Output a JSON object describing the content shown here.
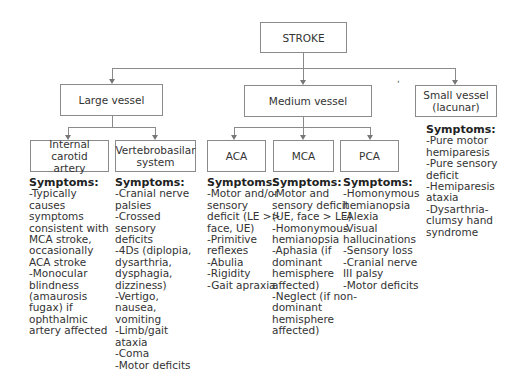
{
  "root": {
    "label": "STROKE"
  },
  "level1": [
    {
      "label": "Large vessel"
    },
    {
      "label": "Medium vessel"
    },
    {
      "label": "Small vessel\n(lacunar)"
    }
  ],
  "large": [
    {
      "label": "Internal carotid\nartery",
      "symptoms_title": "Symptoms:",
      "symptoms": "-Typically\ncauses\nsymptoms\nconsistent with\nMCA stroke,\noccasionally\nACA stroke\n-Monocular\nblindness\n(amaurosis\nfugax) if\nophthalmic\nartery affected"
    },
    {
      "label": "Vertebrobasilar\nsystem",
      "symptoms_title": "Symptoms:",
      "symptoms": "-Cranial nerve\npalsies\n-Crossed\nsensory\ndeficits\n-4Ds (diplopia,\ndysarthria,\ndysphagia,\ndizziness)\n-Vertigo,\nnausea,\nvomiting\n-Limb/gait\nataxia\n-Coma\n-Motor deficits"
    }
  ],
  "medium": [
    {
      "label": "ACA",
      "symptoms_title": "Symptoms:",
      "symptoms": "-Motor and/or\nsensory\ndeficit (LE >>\nface, UE)\n-Primitive\nreflexes\n-Abulia\n-Rigidity\n-Gait apraxia"
    },
    {
      "label": "MCA",
      "symptoms_title": "Symptoms:",
      "symptoms": "-Motor and\nsensory deficit\n(UE, face > LE)\n-Homonymous\nhemianopsia\n-Aphasia (if\ndominant\nhemisphere\naffected)\n-Neglect (if non-\ndominant\nhemisphere\naffected)"
    },
    {
      "label": "PCA",
      "symptoms_title": "Symptoms:",
      "symptoms": "-Homonymous\nhemianopsia\n-Alexia\n-Visual\nhallucinations\n-Sensory loss\n-Cranial nerve\nIII palsy\n-Motor deficits"
    }
  ],
  "small": {
    "symptoms_title": "Symptoms:",
    "symptoms": "-Pure motor\nhemiparesis\n-Pure sensory\ndeficit\n-Hemiparesis\nataxia\n-Dysarthria-\nclumsy hand\nsyndrome"
  },
  "stray_mark": ","
}
